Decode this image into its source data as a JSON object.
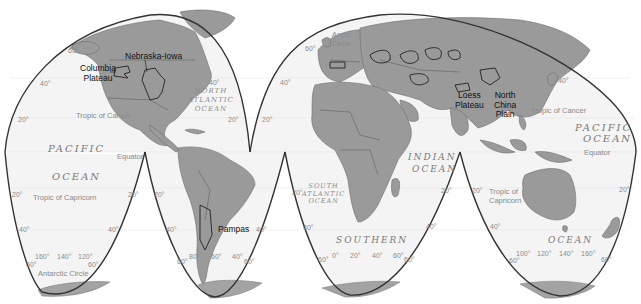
{
  "map": {
    "projection": "Goode homolosine (interrupted)",
    "colors": {
      "land": "#9a9a9a",
      "ocean": "#f4f4f4",
      "outline": "#333333",
      "region_label": "#111111",
      "ocean_label": "#7a7a7a"
    },
    "regions": [
      {
        "label": "Columbia\nPlateau",
        "line1": "Columbia",
        "line2": "Plateau"
      },
      {
        "label": "Nebraska-Iowa"
      },
      {
        "label": "Pampas"
      },
      {
        "label": "Loess Plateau",
        "line1": "Loess",
        "line2": "Plateau"
      },
      {
        "label": "North China Plain",
        "line1": "North",
        "line2": "China",
        "line3": "Plain"
      }
    ],
    "oceans": {
      "north_atlantic": {
        "line1": "NORTH",
        "line2": "ATLANTIC",
        "line3": "OCEAN"
      },
      "pacific_west": {
        "line1": "PACIFIC",
        "line2": "OCEAN"
      },
      "pacific_east": {
        "line1": "PACIFIC",
        "line2": "OCEAN"
      },
      "south_atlantic": {
        "line1": "SOUTH",
        "line2": "ATLANTIC",
        "line3": "OCEAN"
      },
      "indian": {
        "line1": "INDIAN",
        "line2": "OCEAN"
      },
      "southern_1": "SOUTHERN",
      "southern_2": "OCEAN"
    },
    "lines": {
      "tropic_cancer_west": "Tropic of Cancer",
      "tropic_cancer_east": "Tropic of Cancer",
      "tropic_capricorn_west": "Tropic of Capricorn",
      "tropic_capricorn_east_1": "Tropic of",
      "tropic_capricorn_east_2": "Capricorn",
      "equator_west": "Equator",
      "equator_east": "Equator",
      "arctic_circle_1": "Arctic",
      "arctic_circle_2": "Circle",
      "antarctic_circle": "Antarctic Circle"
    },
    "latitude_labels": {
      "n60_left": "60°",
      "n40_left": "40°",
      "n20_left": "20°",
      "n40_atl": "40°",
      "n20_atl": "20°",
      "n60_eur": "60°",
      "n40_eur": "40°",
      "n20_eur": "20°",
      "n40_pac": "40°",
      "s20_a": "20°",
      "s20_b": "20°",
      "s20_c": "20°",
      "s20_d": "20°",
      "s20_e": "20°",
      "s20_f": "20°",
      "s40_a": "40°",
      "s40_b": "40°",
      "s40_c": "40°",
      "s40_d": "40°",
      "s40_e": "40°",
      "s40_f": "40°",
      "s60_a": "60°",
      "s60_b": "60°",
      "s60_c": "60°",
      "s60_d": "60°",
      "s60_e": "60°",
      "s60_f": "60°",
      "s60_g": "60°",
      "s60_h": "60°"
    },
    "longitude_labels": {
      "lobe1": [
        "160°",
        "140°",
        "120°"
      ],
      "lobe2": [
        "80°",
        "60°",
        "40°"
      ],
      "lobe3": [
        "0°",
        "20°",
        "40°",
        "60°"
      ],
      "lobe4": [
        "100°",
        "120°",
        "140°",
        "160°"
      ]
    }
  }
}
